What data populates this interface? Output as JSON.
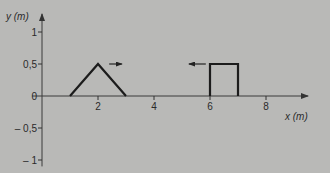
{
  "chart_data": {
    "type": "line",
    "title": "",
    "xlabel": "x (m)",
    "ylabel": "y (m)",
    "xlim": [
      0,
      9.3
    ],
    "ylim": [
      -1.1,
      1.25
    ],
    "x_ticks": [
      2,
      4,
      6,
      8
    ],
    "x_tick_labels": [
      "2",
      "4",
      "6",
      "8"
    ],
    "y_ticks": [
      1,
      0.5,
      0,
      -0.5,
      -1
    ],
    "y_tick_labels": [
      "1",
      "0,5",
      "0",
      "– 0,5",
      "– 1"
    ],
    "grid": false,
    "legend": null,
    "series": [
      {
        "name": "triangular pulse",
        "x": [
          1,
          2,
          3
        ],
        "y": [
          0,
          0.5,
          0
        ],
        "direction": "right",
        "arrow": {
          "x_from": 2.4,
          "x_to": 2.85,
          "y": 0.5
        }
      },
      {
        "name": "rectangular pulse",
        "x": [
          6,
          6,
          7,
          7
        ],
        "y": [
          0,
          0.5,
          0.5,
          0
        ],
        "direction": "left",
        "arrow": {
          "x_from": 5.85,
          "x_to": 5.25,
          "y": 0.5
        }
      }
    ]
  },
  "axes": {
    "x_label": "x (m)",
    "y_label": "y (m)"
  }
}
